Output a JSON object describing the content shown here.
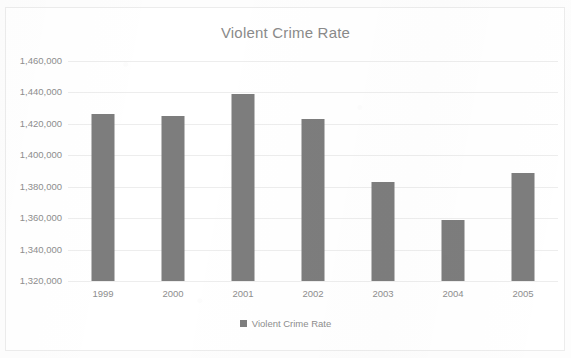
{
  "chart_data": {
    "type": "bar",
    "title": "Violent Crime Rate",
    "xlabel": "",
    "ylabel": "",
    "categories": [
      "1999",
      "2000",
      "2001",
      "2002",
      "2003",
      "2004",
      "2005"
    ],
    "series": [
      {
        "name": "Violent Crime Rate",
        "values": [
          1426000,
          1425000,
          1439000,
          1423000,
          1383000,
          1359000,
          1389000
        ]
      }
    ],
    "ylim": [
      1320000,
      1460000
    ],
    "ytick_values": [
      1460000,
      1440000,
      1420000,
      1400000,
      1380000,
      1360000,
      1340000,
      1320000
    ],
    "ytick_labels": [
      "1,460,000",
      "1,440,000",
      "1,420,000",
      "1,400,000",
      "1,380,000",
      "1,360,000",
      "1,340,000",
      "1,320,000"
    ],
    "grid": true,
    "legend_position": "bottom",
    "bar_color": "#7d7d7d",
    "grid_color": "#ededed",
    "text_color": "#8e8e8e",
    "title_color": "#8a8a8a"
  },
  "legend": {
    "entries": [
      {
        "label": "Violent Crime Rate",
        "color": "#7d7d7d",
        "marker": "square-marker"
      }
    ]
  }
}
